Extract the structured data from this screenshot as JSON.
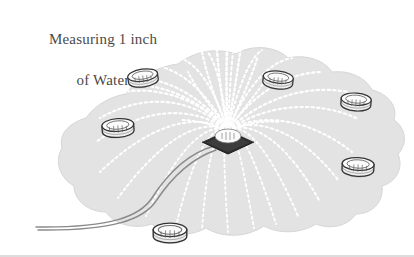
{
  "figure": {
    "title_line_1": "Measuring 1 inch",
    "title_line_2": "of Water",
    "width": 414,
    "height": 257,
    "background_color": "#ffffff",
    "wetted_area_color": "#e3e3e3",
    "wetted_area_edge_color": "#d8d8d8",
    "spray_color": "#ffffff",
    "can_body_color": "#f2f2f2",
    "can_outline_color": "#3a3a3a",
    "can_shadow_color": "#8d8d8d",
    "sprinkler_base_color": "#2e2e2e",
    "sprinkler_head_color": "#ffffff",
    "hose_color": "#8a8a8a",
    "border_color": "#b9b9b9",
    "text_color": "#4a4a4a"
  },
  "elements": {
    "wetted_area_label": "wetted lawn area",
    "sprinkler_label": "oscillating sprinkler",
    "hose_label": "garden hose",
    "spray_label": "water spray arcs",
    "can_label": "catch can"
  },
  "catch_cans": [
    {
      "name": "catch-can-upper-left",
      "x": 143,
      "y": 78,
      "w": 30,
      "h": 19,
      "rot": -8
    },
    {
      "name": "catch-can-upper-right",
      "x": 278,
      "y": 80,
      "w": 30,
      "h": 19,
      "rot": 6
    },
    {
      "name": "catch-can-right-upper",
      "x": 356,
      "y": 102,
      "w": 30,
      "h": 19,
      "rot": 4
    },
    {
      "name": "catch-can-left",
      "x": 118,
      "y": 128,
      "w": 32,
      "h": 20,
      "rot": -4
    },
    {
      "name": "catch-can-right-lower",
      "x": 358,
      "y": 167,
      "w": 32,
      "h": 20,
      "rot": 3
    },
    {
      "name": "catch-can-bottom",
      "x": 170,
      "y": 233,
      "w": 34,
      "h": 21,
      "rot": 0
    }
  ],
  "sprinkler": {
    "center_x": 228,
    "center_y": 142,
    "base_half_width": 26,
    "base_half_height": 12
  },
  "spray": {
    "arc_count": 26,
    "origin_x": 228,
    "origin_y": 132,
    "plume_top_y": 28
  },
  "hose": {
    "start_x": 212,
    "start_y": 147,
    "end_x": 36,
    "end_y": 227
  }
}
